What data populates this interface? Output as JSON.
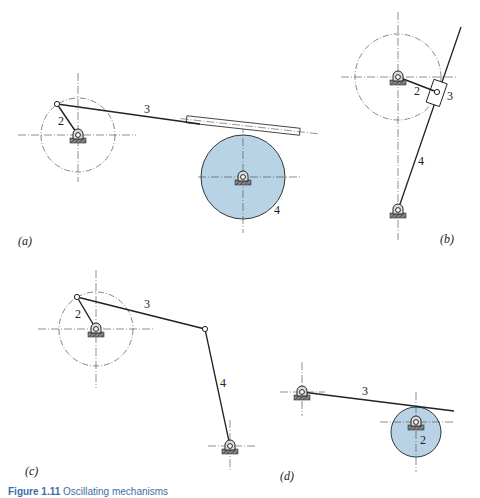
{
  "figure": {
    "caption_number": "Figure 1.11",
    "caption_text": "Oscillating mechanisms",
    "caption_color": "#3a6ea5",
    "disk_fill": "#b8d3e6",
    "line_color": "#222222"
  },
  "panels": [
    {
      "id": "a",
      "label": "(a)",
      "links": [
        "2",
        "3",
        "4"
      ],
      "description": "Crank 2 rotating about pivot, link 3 sliding in slotted guide attached to large disk 4"
    },
    {
      "id": "b",
      "label": "(b)",
      "links": [
        "2",
        "3",
        "4"
      ],
      "description": "Crank 2 with slider block 3 on oscillating arm 4 pivoted below"
    },
    {
      "id": "c",
      "label": "(c)",
      "links": [
        "2",
        "3",
        "4"
      ],
      "description": "Four-bar linkage: crank 2, coupler 3, rocker 4"
    },
    {
      "id": "d",
      "label": "(d)",
      "links": [
        "3",
        "2"
      ],
      "description": "Disk cam 2 driving oscillating follower arm 3"
    }
  ],
  "labels": {
    "a_2": "2",
    "a_3": "3",
    "a_4": "4",
    "b_2": "2",
    "b_3": "3",
    "b_4": "4",
    "c_2": "2",
    "c_3": "3",
    "c_4": "4",
    "d_3": "3",
    "d_2": "2"
  }
}
